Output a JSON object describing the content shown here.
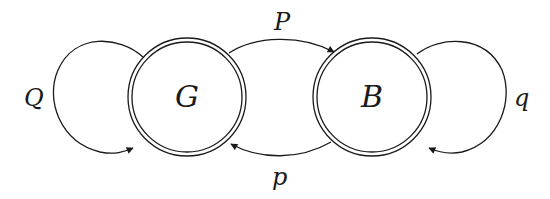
{
  "diagram": {
    "type": "state-transition",
    "stroke_color": "#1a1a1a",
    "background": "#ffffff",
    "states": [
      {
        "id": "G",
        "label": "G",
        "double_circle": true
      },
      {
        "id": "B",
        "label": "B",
        "double_circle": true
      }
    ],
    "transitions": [
      {
        "from": "G",
        "to": "G",
        "label": "Q",
        "kind": "self-loop-left"
      },
      {
        "from": "G",
        "to": "B",
        "label": "P",
        "kind": "arc-top"
      },
      {
        "from": "B",
        "to": "G",
        "label": "p",
        "kind": "arc-bottom"
      },
      {
        "from": "B",
        "to": "B",
        "label": "q",
        "kind": "self-loop-right"
      }
    ]
  }
}
